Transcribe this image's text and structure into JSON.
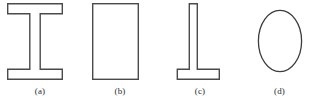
{
  "figure": {
    "kind": "cross-section-shapes",
    "background_color": "#ffffff",
    "stroke_color": "#4a4a4a",
    "fill_color": "#ffffff",
    "stroke_width": 1.4,
    "label_color": "#2b2b2b",
    "label_font_size": 9,
    "width": 319,
    "height": 106
  },
  "shapes": [
    {
      "id": "shape-a",
      "label": "(a)",
      "name": "i-beam-cross-section",
      "geometry": "i-beam",
      "bbox": {
        "x": 7,
        "y": 3,
        "width": 55,
        "height": 77
      },
      "params": {
        "flange_width": 55,
        "flange_thickness": 10,
        "web_thickness": 10,
        "total_height": 77
      }
    },
    {
      "id": "shape-b",
      "label": "(b)",
      "name": "rectangle-cross-section",
      "geometry": "rectangle",
      "bbox": {
        "x": 92,
        "y": 3,
        "width": 46,
        "height": 77
      },
      "params": {
        "width": 46,
        "height": 77
      }
    },
    {
      "id": "shape-c",
      "label": "(c)",
      "name": "inverted-tee-cross-section",
      "geometry": "inverted-tee",
      "bbox": {
        "x": 177,
        "y": 3,
        "width": 43,
        "height": 77
      },
      "params": {
        "flange_width": 43,
        "flange_thickness": 10,
        "web_thickness": 8,
        "total_height": 77
      }
    },
    {
      "id": "shape-d",
      "label": "(d)",
      "name": "circle-cross-section",
      "geometry": "circle",
      "bbox": {
        "x": 258,
        "y": 10,
        "width": 44,
        "height": 62
      },
      "params": {
        "radius_x": 22,
        "radius_y": 31
      }
    }
  ]
}
